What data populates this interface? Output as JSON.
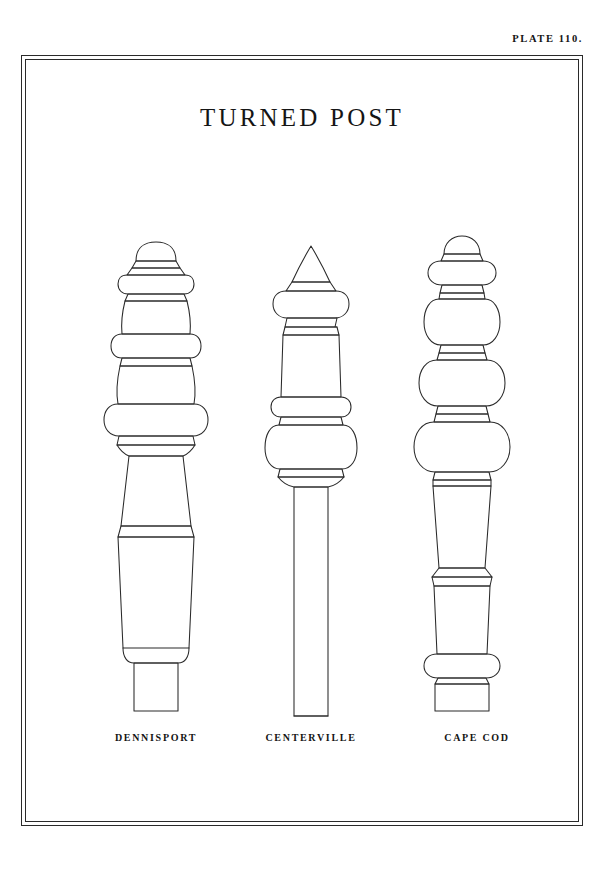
{
  "plate": {
    "number_label": "PLATE 110.",
    "title": "TURNED POST"
  },
  "figures": [
    {
      "id": "dennisport",
      "caption": "DENNISPORT",
      "description": "Turned newel post with domed cap, stacked collars, three ring-and-bulb turnings, flaring tapered shaft and small square base block"
    },
    {
      "id": "centerville",
      "caption": "CENTERVILLE",
      "description": "Turned newel post with pointed conical finial, flattened torus, square neck block, large bulb turning and plain straight square shaft"
    },
    {
      "id": "cape-cod",
      "caption": "CAPE COD",
      "description": "Turned newel post with rounded dome cap, flared collar, three graduated spherical bulbs, tapered shaft, lower torus and wide square plinth"
    }
  ],
  "style": {
    "ink": "#2a2a2a",
    "paper": "#ffffff"
  }
}
